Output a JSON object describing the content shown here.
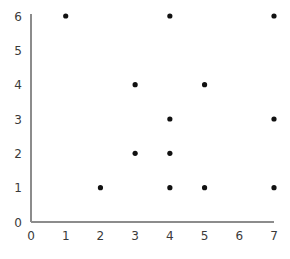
{
  "chart_data": {
    "type": "scatter",
    "title": "",
    "subtitle": "",
    "xlabel": "",
    "ylabel": "",
    "xlim": [
      0,
      7
    ],
    "ylim": [
      0,
      6
    ],
    "xticks": [
      0,
      1,
      2,
      3,
      4,
      5,
      6,
      7
    ],
    "yticks": [
      0,
      1,
      2,
      3,
      4,
      5,
      6
    ],
    "xtick_labels": [
      "0",
      "1",
      "2",
      "3",
      "4",
      "5",
      "6",
      "7"
    ],
    "ytick_labels": [
      "0",
      "1",
      "2",
      "3",
      "4",
      "5",
      "6"
    ],
    "grid": false,
    "legend": null,
    "legend_position": "none",
    "annotations": [],
    "marker": {
      "shape": "circle",
      "color": "#111111",
      "size_px": 4
    },
    "axis_color": "#8c8c8c",
    "background_color": "#ffffff",
    "x": [
      1,
      4,
      7,
      3,
      5,
      4,
      7,
      3,
      4,
      2,
      4,
      5,
      7
    ],
    "y": [
      6,
      6,
      6,
      4,
      4,
      3,
      3,
      2,
      2,
      1,
      1,
      1,
      1
    ],
    "points": [
      {
        "x": 1,
        "y": 6
      },
      {
        "x": 4,
        "y": 6
      },
      {
        "x": 7,
        "y": 6
      },
      {
        "x": 3,
        "y": 4
      },
      {
        "x": 5,
        "y": 4
      },
      {
        "x": 4,
        "y": 3
      },
      {
        "x": 7,
        "y": 3
      },
      {
        "x": 3,
        "y": 2
      },
      {
        "x": 4,
        "y": 2
      },
      {
        "x": 2,
        "y": 1
      },
      {
        "x": 4,
        "y": 1
      },
      {
        "x": 5,
        "y": 1
      },
      {
        "x": 7,
        "y": 1
      }
    ]
  },
  "figure": {
    "name": "scatter-plot"
  }
}
